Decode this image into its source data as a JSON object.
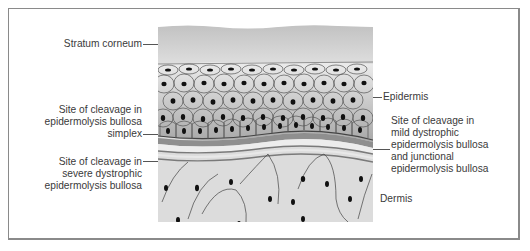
{
  "figure": {
    "labels": {
      "stratum_corneum": "Stratum corneum",
      "epidermis": "Epidermis",
      "dermis": "Dermis",
      "simplex": {
        "line1": "Site of cleavage in",
        "line2": "epidermolysis bullosa",
        "line3": "simplex"
      },
      "severe_dystrophic": {
        "line1": "Site of cleavage in",
        "line2": "severe dystrophic",
        "line3": "epidermolysis bullosa"
      },
      "mild_junctional": {
        "line1": "Site of cleavage in",
        "line2": "mild dystrophic",
        "line3": "epidermolysis bullosa",
        "line4": "and junctional",
        "line5": "epidermolysis bullosa"
      }
    },
    "colors": {
      "stratum_corneum": "#c9c9c9",
      "epidermis_top": "#e4e4e4",
      "epidermis_bottom": "#a9a9a9",
      "basal_layer": "#8f8f8f",
      "dermis": "#dcdcdc",
      "nucleus": "#111111",
      "frame_border": "#8a8a8a"
    }
  }
}
